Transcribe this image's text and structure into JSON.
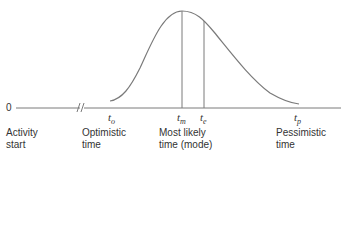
{
  "diagram": {
    "type": "beta-distribution-time-estimate",
    "axis": {
      "origin_label": "0",
      "has_axis_break": true
    },
    "points": [
      {
        "id": "start",
        "symbol": "",
        "label_line1": "Activity",
        "label_line2": "start"
      },
      {
        "id": "t_o",
        "symbol_base": "t",
        "symbol_sub": "o",
        "label_line1": "Optimistic",
        "label_line2": "time"
      },
      {
        "id": "t_m",
        "symbol_base": "t",
        "symbol_sub": "m",
        "label_line1": "Most likely",
        "label_line2": "time (mode)"
      },
      {
        "id": "t_e",
        "symbol_base": "t",
        "symbol_sub": "e",
        "label_line1": "",
        "label_line2": ""
      },
      {
        "id": "t_p",
        "symbol_base": "t",
        "symbol_sub": "p",
        "label_line1": "Pessimistic",
        "label_line2": "time"
      }
    ],
    "colors": {
      "curve": "#7a7a7a",
      "axis": "#7a7a7a",
      "text": "#333333"
    }
  }
}
